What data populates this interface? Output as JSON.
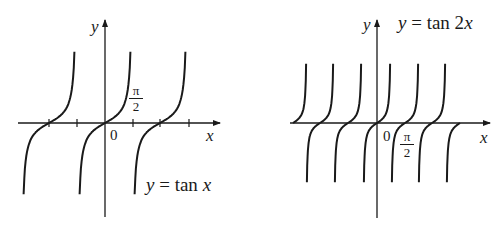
{
  "chart_data": [
    {
      "type": "line",
      "title": "y = tan x",
      "function": "tan(x)",
      "xlabel": "x",
      "ylabel": "y",
      "origin_label": "0",
      "tick_label": "π/2",
      "tick_label_num": "π",
      "tick_label_den": "2",
      "period": "π",
      "zeros": [
        "-π",
        "0",
        "π"
      ],
      "asymptotes": [
        "-3π/2",
        "-π/2",
        "π/2",
        "3π/2"
      ],
      "x_ticks": [
        "-π/2",
        "π/2",
        "3π/2"
      ],
      "xlim": [
        "-3π/2",
        "3π/2"
      ],
      "grid": false,
      "legend": "none"
    },
    {
      "type": "line",
      "title": "y = tan 2x",
      "function": "tan(2x)",
      "xlabel": "x",
      "ylabel": "y",
      "origin_label": "0",
      "tick_label": "π/2",
      "tick_label_num": "π",
      "tick_label_den": "2",
      "period": "π/2",
      "zeros": [
        "-3π/2",
        "-π",
        "-π/2",
        "0",
        "π/2",
        "π",
        "3π/2"
      ],
      "grid": false,
      "legend": "none"
    }
  ],
  "left": {
    "equation_lhs": "y",
    "equation_rhs": "= tan ",
    "equation_var": "x",
    "axis_x": "x",
    "axis_y": "y",
    "origin": "0",
    "tick_num": "π",
    "tick_den": "2"
  },
  "right": {
    "equation_lhs": "y",
    "equation_rhs": "= tan 2",
    "equation_var": "x",
    "axis_x": "x",
    "axis_y": "y",
    "origin": "0",
    "tick_num": "π",
    "tick_den": "2"
  }
}
